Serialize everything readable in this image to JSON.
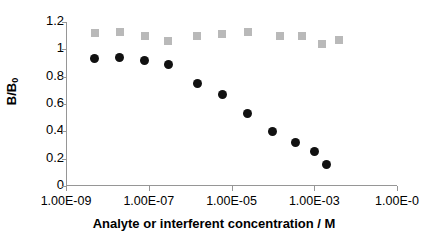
{
  "chart_data": {
    "type": "scatter",
    "title": "",
    "xlabel": "Analyte or interferent concentration / M",
    "ylabel": "B/B0",
    "ylabel_main": "B/B",
    "ylabel_sub": "0",
    "xscale": "log",
    "xlim": [
      1e-09,
      0.1
    ],
    "ylim": [
      0,
      1.2
    ],
    "grid": false,
    "legend": "none",
    "yticks": [
      "1.2",
      "1",
      "0.8",
      "0.6",
      "0.4",
      "0.2",
      "0"
    ],
    "ytick_values": [
      1.2,
      1.0,
      0.8,
      0.6,
      0.4,
      0.2,
      0
    ],
    "xticks": [
      "1.00E-09",
      "1.00E-07",
      "1.00E-05",
      "1.00E-03",
      "1.00E-0"
    ],
    "xtick_values": [
      1e-09,
      1e-07,
      1e-05,
      0.001,
      0.1
    ],
    "series": [
      {
        "name": "analyte",
        "marker": "circle",
        "color": "#111111",
        "x": [
          5e-09,
          2e-08,
          8e-08,
          3e-07,
          1.5e-06,
          6e-06,
          2.5e-05,
          0.0001,
          0.00035,
          0.001,
          0.002
        ],
        "values": [
          0.93,
          0.94,
          0.92,
          0.89,
          0.75,
          0.67,
          0.53,
          0.4,
          0.32,
          0.25,
          0.16
        ]
      },
      {
        "name": "interferent",
        "marker": "square",
        "color": "#b9b9b9",
        "x": [
          5e-09,
          2e-08,
          8e-08,
          3e-07,
          1.5e-06,
          6e-06,
          2.5e-05,
          0.00015,
          0.0005,
          0.0015,
          0.004
        ],
        "values": [
          1.12,
          1.13,
          1.1,
          1.06,
          1.1,
          1.11,
          1.13,
          1.1,
          1.1,
          1.04,
          1.07
        ]
      }
    ]
  }
}
